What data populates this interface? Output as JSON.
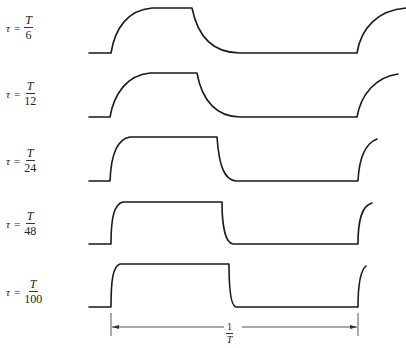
{
  "diagram": {
    "type": "waveform-stack",
    "rows": [
      {
        "symbol": "τ",
        "equals": "=",
        "numerator": "T",
        "denominator": "6"
      },
      {
        "symbol": "τ",
        "equals": "=",
        "numerator": "T",
        "denominator": "12"
      },
      {
        "symbol": "τ",
        "equals": "=",
        "numerator": "T",
        "denominator": "24"
      },
      {
        "symbol": "τ",
        "equals": "=",
        "numerator": "T",
        "denominator": "48"
      },
      {
        "symbol": "τ",
        "equals": "=",
        "numerator": "T",
        "denominator": "100"
      }
    ],
    "dimension": {
      "numerator": "1",
      "denominator": "T"
    },
    "colors": {
      "stroke": "#1a1a1a",
      "dimension": "#555555",
      "background": "#ffffff"
    }
  }
}
